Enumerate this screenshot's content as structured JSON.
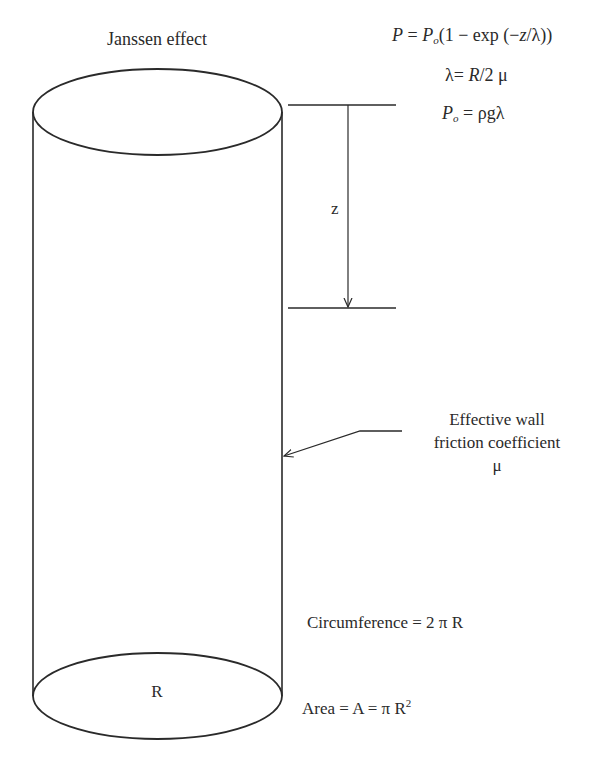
{
  "diagram": {
    "title": "Janssen effect",
    "equations": {
      "pressure": {
        "lhs": "P",
        "eq": " = ",
        "p0": "P",
        "p0_sub": "o",
        "rhs_open": "(1 − exp (−",
        "z": "z",
        "slash": "/λ))"
      },
      "lambda": {
        "lhs": "λ= ",
        "R": "R",
        "rhs": "/2 μ"
      },
      "p0_def": {
        "lhs": "P",
        "lhs_sub": "o",
        "rhs": " = ρgλ"
      }
    },
    "depth_label": "z",
    "wall_label": {
      "line1": "Effective wall",
      "line2": "friction coefficient",
      "line3": "μ"
    },
    "circumference": "Circumference = 2 π R",
    "area": {
      "text": "Area = A = π R",
      "exponent": "2"
    },
    "radius_label": "R",
    "colors": {
      "stroke": "#2a2a2a",
      "background": "#ffffff"
    }
  }
}
